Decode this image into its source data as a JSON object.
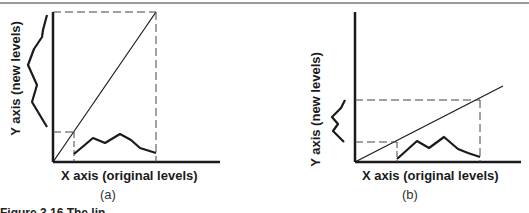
{
  "panels": [
    {
      "id": "a",
      "sublabel": "(a)",
      "x_axis_label": "X axis (original levels)",
      "y_axis_label": "Y axis (new levels)",
      "mapping": "identity (slope 1, diagonal)"
    },
    {
      "id": "b",
      "sublabel": "(b)",
      "x_axis_label": "X axis (original levels)",
      "y_axis_label": "Y axis (new levels)",
      "mapping": "compressed (slope < 1)"
    }
  ],
  "caption": {
    "text": "Figure 3.16   The lin..."
  },
  "colors": {
    "line": "#1a1a1a",
    "dashed": "#444444",
    "rule": "#9a9a9a"
  }
}
